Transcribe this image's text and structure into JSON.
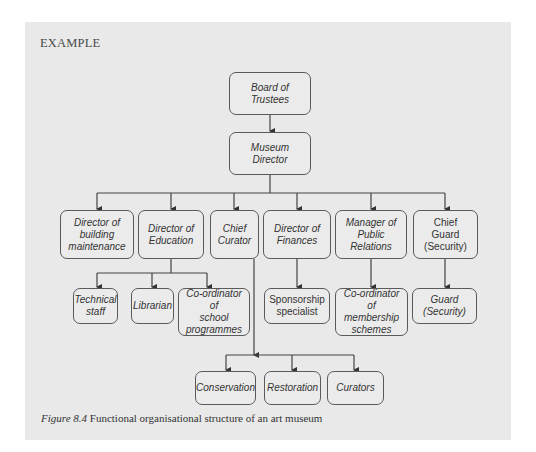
{
  "heading": "EXAMPLE",
  "nodes": {
    "board": "Board of\nTrustees",
    "director": "Museum\nDirector",
    "building": "Director of\nbuilding\nmaintenance",
    "education": "Director of\nEducation",
    "curator": "Chief\nCurator",
    "finances": "Director of\nFinances",
    "pr": "Manager of\nPublic\nRelations",
    "guard_chief": "Chief\nGuard\n(Security)",
    "technical": "Technical\nstaff",
    "librarian": "Librarian",
    "school": "Co-ordinator of\nschool\nprogrammes",
    "sponsorship": "Sponsorship\nspecialist",
    "membership": "Co-ordinator of\nmembership\nschemes",
    "guard": "Guard\n(Security)",
    "conservation": "Conservation",
    "restoration": "Restoration",
    "curators": "Curators"
  },
  "caption": {
    "label": "Figure 8.4",
    "text": " Functional organisational structure of an art museum"
  },
  "colors": {
    "panel": "#e9e9e9",
    "line": "#444444",
    "text": "#333333"
  }
}
